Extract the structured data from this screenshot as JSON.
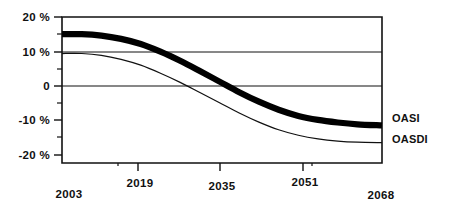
{
  "chart_data": {
    "type": "line",
    "title": "",
    "subtitle": "",
    "xlabel": "",
    "ylabel": "",
    "xlim": [
      2003,
      2068
    ],
    "ylim": [
      -20,
      20
    ],
    "grid": false,
    "legend_position": "right-inline",
    "y_tick_labels": [
      "20 %",
      "10 %",
      "0",
      "-10 %",
      "-20 %"
    ],
    "y_tick_values": [
      20,
      10,
      0,
      -10,
      -20
    ],
    "y_minor_tick_values": [
      15,
      5,
      -5,
      -15
    ],
    "x_tick_labels": [
      "2003",
      "2019",
      "2035",
      "2051",
      "2068"
    ],
    "x_tick_values": [
      2003,
      2019,
      2035,
      2051,
      2068
    ],
    "series": [
      {
        "name": "OASI",
        "style": "thick-black",
        "x": [
          2003,
          2007,
          2011,
          2015,
          2019,
          2023,
          2027,
          2031,
          2035,
          2039,
          2043,
          2047,
          2051,
          2055,
          2059,
          2063,
          2068
        ],
        "values": [
          15.3,
          15.3,
          14.9,
          14.0,
          12.6,
          10.5,
          8.0,
          5.2,
          2.3,
          -0.6,
          -3.2,
          -5.4,
          -7.1,
          -8.2,
          -8.9,
          -9.4,
          -9.7
        ]
      },
      {
        "name": "OASDI",
        "style": "thin-black",
        "x": [
          2003,
          2007,
          2011,
          2015,
          2019,
          2023,
          2027,
          2031,
          2035,
          2039,
          2043,
          2047,
          2051,
          2055,
          2059,
          2063,
          2068
        ],
        "values": [
          10.0,
          10.0,
          9.5,
          8.4,
          6.8,
          4.6,
          2.1,
          -0.7,
          -3.5,
          -6.3,
          -8.8,
          -10.9,
          -12.4,
          -13.4,
          -14.0,
          -14.3,
          -14.4
        ]
      }
    ],
    "series_labels": [
      {
        "text": "OASI"
      },
      {
        "text": "OASDI"
      }
    ],
    "colors": {
      "axis": "#111111",
      "series_oasi": "#000000",
      "series_oasdi": "#111111",
      "background": "#ffffff"
    }
  }
}
